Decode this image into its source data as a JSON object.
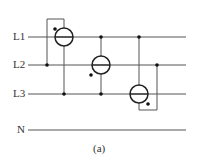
{
  "diagram": {
    "caption": "(a)",
    "lines": [
      {
        "label": "L1",
        "y": 37
      },
      {
        "label": "L2",
        "y": 65
      },
      {
        "label": "L3",
        "y": 94
      },
      {
        "label": "N",
        "y": 130
      }
    ],
    "line_color": "#555555",
    "stroke_color": "#222222",
    "meters": [
      {
        "id": "meter-1",
        "cx": 64,
        "cy": 37
      },
      {
        "id": "meter-2",
        "cx": 101,
        "cy": 65
      },
      {
        "id": "meter-3",
        "cx": 139,
        "cy": 94
      }
    ]
  }
}
